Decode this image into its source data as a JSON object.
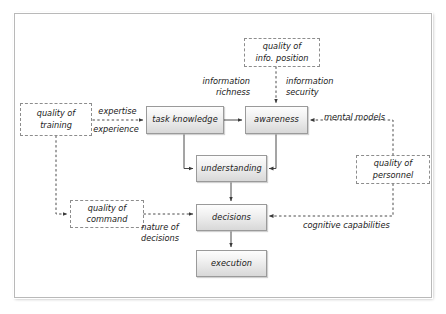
{
  "diagram": {
    "frame": {
      "border_color": "#b9b9b9"
    },
    "process_nodes": [
      {
        "id": "task_knowledge",
        "label": "task knowledge"
      },
      {
        "id": "awareness",
        "label": "awareness"
      },
      {
        "id": "understanding",
        "label": "understanding"
      },
      {
        "id": "decisions",
        "label": "decisions"
      },
      {
        "id": "execution",
        "label": "execution"
      }
    ],
    "factor_nodes": [
      {
        "id": "quality_of_training",
        "label": "quality of\ntraining"
      },
      {
        "id": "quality_of_info_position",
        "label": "quality of\ninfo. position"
      },
      {
        "id": "quality_of_personnel",
        "label": "quality of\npersonnel"
      },
      {
        "id": "quality_of_command",
        "label": "quality of\ncommand"
      }
    ],
    "edge_labels": [
      {
        "id": "expertise",
        "label": "expertise"
      },
      {
        "id": "experience",
        "label": "experience"
      },
      {
        "id": "information_richness",
        "label": "information\nrichness"
      },
      {
        "id": "information_security",
        "label": "information\nsecurity"
      },
      {
        "id": "mental_models",
        "label": "mental models"
      },
      {
        "id": "cognitive_capabilities",
        "label": "cognitive capabilities"
      },
      {
        "id": "nature_of_decisions",
        "label": "nature of\ndecisions"
      }
    ],
    "colors": {
      "node_border": "#9a9a9a",
      "node_fill_top": "#fdfdfd",
      "node_fill_bottom": "#d8d8d8",
      "factor_border": "#8d8d8d",
      "connector": "#4a4a4a",
      "text": "#1a1a1a"
    }
  }
}
